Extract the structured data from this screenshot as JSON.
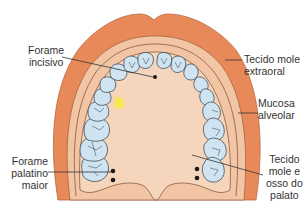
{
  "figure": {
    "colors": {
      "extraoral_soft_tissue": "#e8895a",
      "extraoral_outline": "#b9683f",
      "alveolar_mucosa": "#f2c6a4",
      "palate": "#f5d6bd",
      "tooth_fill": "#cfe3f0",
      "tooth_outline": "#2b3a4a",
      "highlight": "#f5e84a",
      "foramen": "#1a1a1a",
      "leader_line": "#333333"
    },
    "labels": {
      "forame_incisivo": [
        "Forame",
        "incisivo"
      ],
      "tecido_mole_extraoral": [
        "Tecido mole",
        "extraoral"
      ],
      "mucosa_alveolar": [
        "Mucosa",
        "alveolar"
      ],
      "forame_palatino_maior": [
        "Forame",
        "palatino",
        "maior"
      ],
      "tecido_mole_osso_palato": [
        "Tecido",
        "mole e",
        "osso do",
        "palato"
      ]
    }
  }
}
